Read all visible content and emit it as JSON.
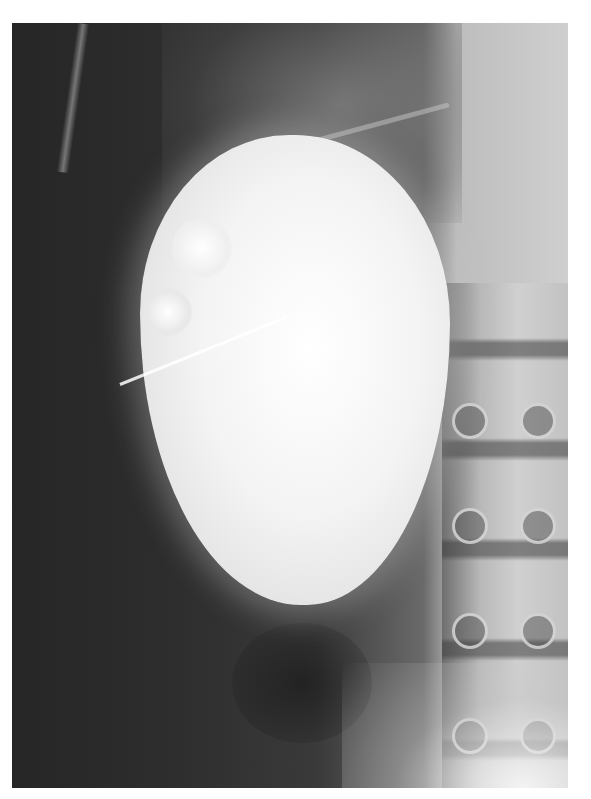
{
  "image": {
    "type": "radiograph",
    "description": "Grayscale abdominal X-ray showing a large, bright, oval contrast-filled structure (enlarged kidney / renal pelvis) with a thin catheter line crossing its lower-left portion, lumbar vertebrae visible along the right edge",
    "colors": {
      "background": "#ffffff",
      "soft_tissue_dark": "#2a2a2a",
      "contrast_bright": "#f4f4f4",
      "bone": "#c8c8c8"
    }
  }
}
